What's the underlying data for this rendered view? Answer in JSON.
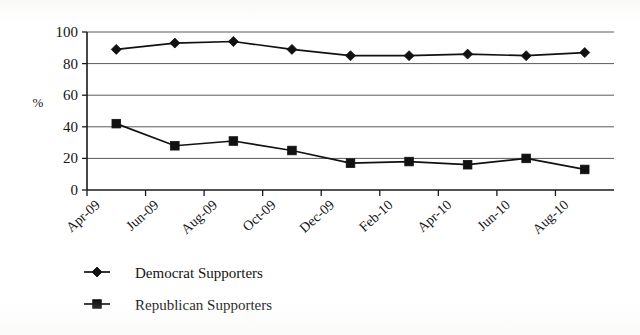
{
  "chart_data": {
    "type": "line",
    "title": "",
    "subtitle": "",
    "xlabel": "",
    "ylabel": "%",
    "ylim": [
      0,
      100
    ],
    "yticks": [
      0,
      20,
      40,
      60,
      80,
      100
    ],
    "grid": true,
    "legend_position": "bottom-left",
    "x": [
      "Apr-09",
      "Jun-09",
      "Aug-09",
      "Oct-09",
      "Dec-09",
      "Feb-10",
      "Apr-10",
      "Jun-10",
      "Aug-10"
    ],
    "categories": [
      "Apr-09",
      "Jun-09",
      "Aug-09",
      "Oct-09",
      "Dec-09",
      "Feb-10",
      "Apr-10",
      "Jun-10",
      "Aug-10"
    ],
    "tick_labels": [
      "Apr-09",
      "Jun-09",
      "Aug-09",
      "Oct-09",
      "Dec-09",
      "Feb-10",
      "Apr-10",
      "Jun-10",
      "Aug-10"
    ],
    "series": [
      {
        "name": "Democrat Supporters",
        "marker": "diamond",
        "color": "#111111",
        "values": [
          89,
          93,
          94,
          89,
          85,
          85,
          86,
          85,
          87
        ]
      },
      {
        "name": "Republican Supporters",
        "marker": "square",
        "color": "#111111",
        "values": [
          42,
          28,
          31,
          25,
          17,
          18,
          16,
          20,
          13
        ]
      }
    ]
  },
  "axes": {
    "y_label": "%",
    "y_tick_labels": [
      "0",
      "20",
      "40",
      "60",
      "80",
      "100"
    ],
    "x_tick_labels": [
      "Apr-09",
      "Jun-09",
      "Aug-09",
      "Oct-09",
      "Dec-09",
      "Feb-10",
      "Apr-10",
      "Jun-10",
      "Aug-10"
    ]
  },
  "legend": {
    "entries": [
      {
        "label": "Democrat Supporters",
        "marker": "diamond-marker"
      },
      {
        "label": "Republican Supporters",
        "marker": "square-marker"
      }
    ]
  }
}
